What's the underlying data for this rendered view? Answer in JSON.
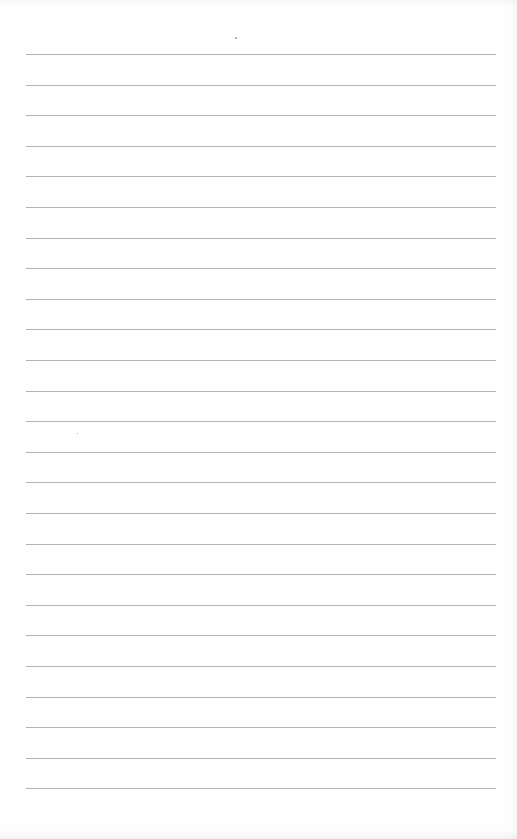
{
  "page": {
    "type": "lined-paper",
    "line_count": 25,
    "first_line_y": 54,
    "line_spacing": 30.6,
    "line_left": 26,
    "line_width": 470,
    "line_color": "#b5b5b5",
    "background": "#fdfdfd"
  }
}
